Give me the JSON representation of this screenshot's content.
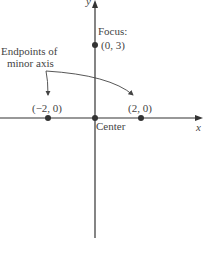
{
  "diagram": {
    "axes": {
      "x_label": "x",
      "y_label": "y"
    },
    "points": [
      {
        "name": "focus",
        "label_line1": "Focus:",
        "label_line2": "(0, 3)"
      },
      {
        "name": "left-endpoint",
        "label": "(−2, 0)"
      },
      {
        "name": "center",
        "label": "Center"
      },
      {
        "name": "right-endpoint",
        "label": "(2, 0)"
      }
    ],
    "annotation": {
      "line1": "Endpoints of",
      "line2": "minor axis"
    },
    "colors": {
      "axis": "#333333",
      "point": "#333333",
      "text": "#444444"
    }
  }
}
